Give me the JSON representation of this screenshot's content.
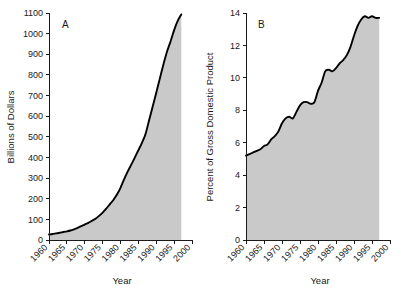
{
  "figure": {
    "background_color": "#ffffff",
    "fill_color": "#c9c9c9",
    "line_color": "#000000",
    "axis_color": "#1a1a1a"
  },
  "chart_data": [
    {
      "type": "area",
      "panel_label": "A",
      "title": "",
      "xlabel": "Year",
      "ylabel": "Billions of Dollars",
      "xlim": [
        1960,
        2000
      ],
      "ylim": [
        0,
        1100
      ],
      "xticks": [
        1960,
        1965,
        1970,
        1975,
        1980,
        1985,
        1990,
        1995,
        2000
      ],
      "xticklabels": [
        "1960",
        "1965",
        "1970",
        "1975",
        "1980",
        "1985",
        "1990",
        "1995",
        "2000"
      ],
      "yticks": [
        0,
        100,
        200,
        300,
        400,
        500,
        600,
        700,
        800,
        900,
        1000,
        1100
      ],
      "yticklabels": [
        "0",
        "100",
        "200",
        "300",
        "400",
        "500",
        "600",
        "700",
        "800",
        "900",
        "1000",
        "1100"
      ],
      "grid": false,
      "legend": false,
      "x": [
        1960,
        1961,
        1962,
        1963,
        1964,
        1965,
        1966,
        1967,
        1968,
        1969,
        1970,
        1971,
        1972,
        1973,
        1974,
        1975,
        1976,
        1977,
        1978,
        1979,
        1980,
        1981,
        1982,
        1983,
        1984,
        1985,
        1986,
        1987,
        1988,
        1989,
        1990,
        1991,
        1992,
        1993,
        1994,
        1995,
        1996,
        1997
      ],
      "y": [
        27,
        29,
        32,
        35,
        39,
        42,
        46,
        52,
        59,
        67,
        75,
        83,
        93,
        103,
        117,
        133,
        152,
        173,
        194,
        220,
        253,
        294,
        331,
        365,
        399,
        435,
        471,
        514,
        580,
        647,
        714,
        782,
        850,
        912,
        962,
        1017,
        1062,
        1093
      ],
      "series_name": "National health expenditures",
      "data_end_year": 1997
    },
    {
      "type": "area",
      "panel_label": "B",
      "title": "",
      "xlabel": "Year",
      "ylabel": "Percent of Gross Domestic Product",
      "xlim": [
        1960,
        2000
      ],
      "ylim": [
        0,
        14
      ],
      "xticks": [
        1960,
        1965,
        1970,
        1975,
        1980,
        1985,
        1990,
        1995,
        2000
      ],
      "xticklabels": [
        "1960",
        "1965",
        "1970",
        "1975",
        "1980",
        "1985",
        "1990",
        "1995",
        "2000"
      ],
      "yticks": [
        0,
        2,
        4,
        6,
        8,
        10,
        12,
        14
      ],
      "yticklabels": [
        "0",
        "2",
        "4",
        "6",
        "8",
        "10",
        "12",
        "14"
      ],
      "grid": false,
      "legend": false,
      "x": [
        1960,
        1961,
        1962,
        1963,
        1964,
        1965,
        1966,
        1967,
        1968,
        1969,
        1970,
        1971,
        1972,
        1973,
        1974,
        1975,
        1976,
        1977,
        1978,
        1979,
        1980,
        1981,
        1982,
        1983,
        1984,
        1985,
        1986,
        1987,
        1988,
        1989,
        1990,
        1991,
        1992,
        1993,
        1994,
        1995,
        1996,
        1997
      ],
      "y": [
        5.2,
        5.3,
        5.4,
        5.5,
        5.6,
        5.8,
        5.9,
        6.2,
        6.4,
        6.7,
        7.2,
        7.5,
        7.6,
        7.5,
        7.9,
        8.3,
        8.5,
        8.5,
        8.4,
        8.5,
        9.2,
        9.7,
        10.4,
        10.5,
        10.4,
        10.6,
        10.9,
        11.1,
        11.4,
        11.9,
        12.6,
        13.2,
        13.6,
        13.8,
        13.7,
        13.8,
        13.7,
        13.7
      ],
      "series_name": "Health expenditures as percent of GDP",
      "data_end_year": 1997
    }
  ]
}
